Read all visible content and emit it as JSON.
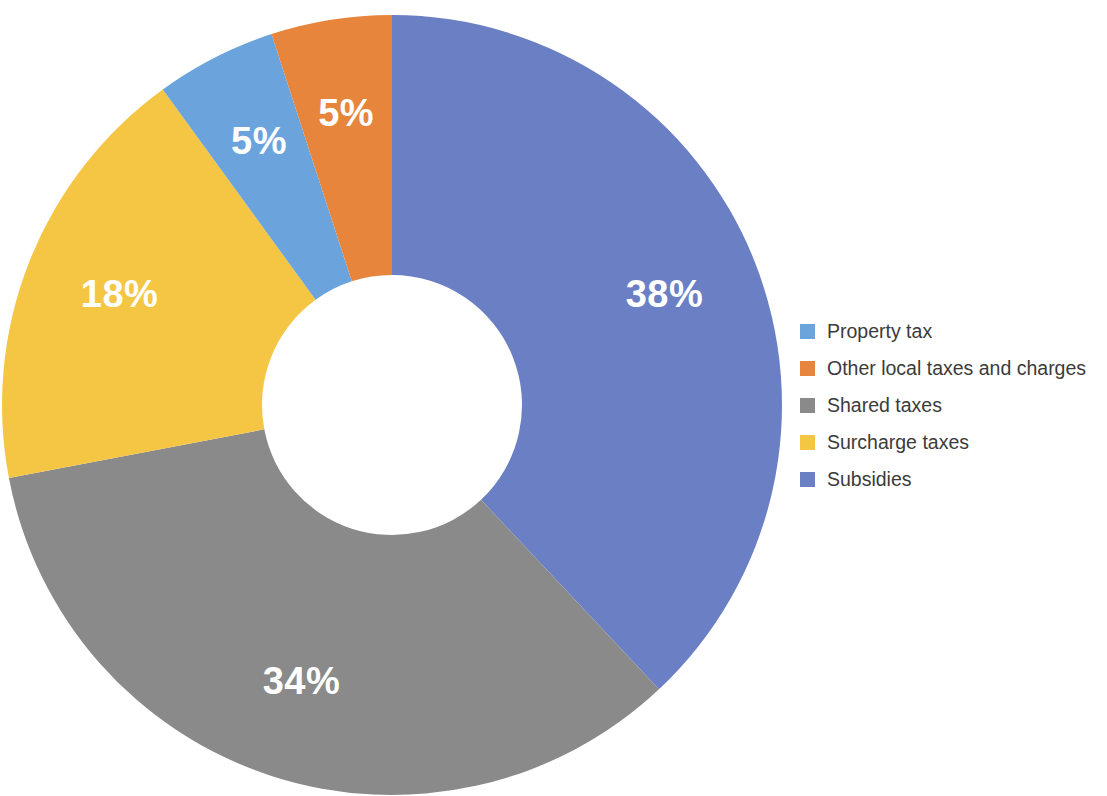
{
  "chart_data": {
    "type": "pie",
    "variant": "donut",
    "title": "",
    "subtitle": "",
    "xlabel": "",
    "ylabel": "",
    "unit": "%",
    "legend_position": "right",
    "grid": false,
    "start_angle_deg": 0,
    "direction": "clockwise",
    "categories": [
      "Subsidies",
      "Shared taxes",
      "Surcharge taxes",
      "Property tax",
      "Other local taxes and charges"
    ],
    "values": [
      38,
      34,
      18,
      5,
      5
    ],
    "data_labels": [
      "38%",
      "34%",
      "18%",
      "5%",
      "5%"
    ],
    "colors": [
      "#6b80c4",
      "#8a8a8a",
      "#f5c544",
      "#6ba3dd",
      "#e8853c"
    ],
    "slices": [
      {
        "label": "Subsidies",
        "value": 38,
        "data_label": "38%",
        "color": "#6b80c4"
      },
      {
        "label": "Shared taxes",
        "value": 34,
        "data_label": "34%",
        "color": "#8a8a8a"
      },
      {
        "label": "Surcharge taxes",
        "value": 18,
        "data_label": "18%",
        "color": "#f5c544"
      },
      {
        "label": "Property tax",
        "value": 5,
        "data_label": "5%",
        "color": "#6ba3dd"
      },
      {
        "label": "Other local taxes and charges",
        "value": 5,
        "data_label": "5%",
        "color": "#e8853c"
      }
    ]
  },
  "legend": {
    "items": [
      {
        "label": "Property tax",
        "color": "#6ba3dd"
      },
      {
        "label": "Other local taxes and charges",
        "color": "#e8853c"
      },
      {
        "label": "Shared taxes",
        "color": "#8a8a8a"
      },
      {
        "label": "Surcharge taxes",
        "color": "#f5c544"
      },
      {
        "label": "Subsidies",
        "color": "#6b80c4"
      }
    ]
  }
}
